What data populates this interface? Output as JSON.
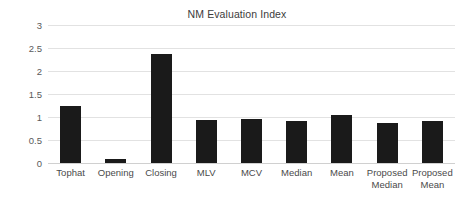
{
  "chart_data": {
    "type": "bar",
    "title": "NM Evaluation Index",
    "xlabel": "",
    "ylabel": "",
    "ylim": [
      0,
      3
    ],
    "yticks": [
      0,
      0.5,
      1,
      1.5,
      2,
      2.5,
      3
    ],
    "ytick_labels": [
      "0",
      "0.5",
      "1",
      "1.5",
      "2",
      "2.5",
      "3"
    ],
    "grid": true,
    "legend": false,
    "bar_color": "#1a1a1a",
    "gridline_color": "#e2e2e2",
    "categories": [
      "Tophat",
      "Opening",
      "Closing",
      "MLV",
      "MCV",
      "Median",
      "Mean",
      "Proposed Median",
      "Proposed Mean"
    ],
    "values": [
      1.23,
      0.08,
      2.38,
      0.94,
      0.96,
      0.91,
      1.04,
      0.88,
      0.92
    ]
  }
}
